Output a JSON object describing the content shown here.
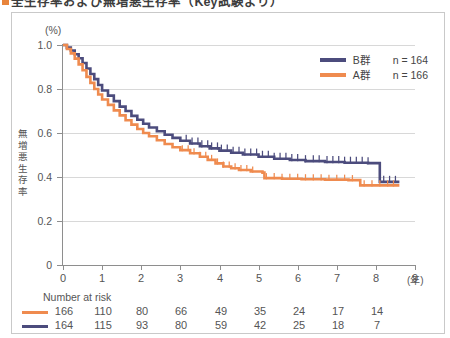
{
  "title": {
    "marker": "■",
    "text": "全生存率および無増悪生存率（Key試験より）"
  },
  "chart_data": {
    "type": "line",
    "subtype": "kaplan-meier",
    "title": "無増悪生存率",
    "xlabel": "(年)",
    "ylabel": "無増悪生存率",
    "yunit": "(%)",
    "xlim": [
      0,
      9
    ],
    "ylim": [
      0,
      1.0
    ],
    "xticks": [
      "0",
      "1",
      "2",
      "3",
      "4",
      "5",
      "6",
      "7",
      "8",
      "9"
    ],
    "yticks": [
      "0",
      "0.2",
      "0.4",
      "0.6",
      "0.8",
      "1.0"
    ],
    "grid": "horizontal",
    "legend_position": "top-right",
    "series": [
      {
        "name": "B群",
        "n_label": "n = 164",
        "n": 164,
        "color": "#4c4c7d",
        "points": [
          [
            0.0,
            1.0
          ],
          [
            0.1,
            0.988
          ],
          [
            0.2,
            0.975
          ],
          [
            0.3,
            0.958
          ],
          [
            0.4,
            0.94
          ],
          [
            0.5,
            0.918
          ],
          [
            0.6,
            0.893
          ],
          [
            0.7,
            0.868
          ],
          [
            0.8,
            0.845
          ],
          [
            0.9,
            0.818
          ],
          [
            1.0,
            0.793
          ],
          [
            1.15,
            0.77
          ],
          [
            1.3,
            0.745
          ],
          [
            1.45,
            0.72
          ],
          [
            1.6,
            0.7
          ],
          [
            1.75,
            0.678
          ],
          [
            1.9,
            0.66
          ],
          [
            2.05,
            0.642
          ],
          [
            2.2,
            0.625
          ],
          [
            2.4,
            0.608
          ],
          [
            2.6,
            0.592
          ],
          [
            2.8,
            0.578
          ],
          [
            3.0,
            0.565
          ],
          [
            3.25,
            0.552
          ],
          [
            3.5,
            0.54
          ],
          [
            3.75,
            0.53
          ],
          [
            4.0,
            0.52
          ],
          [
            4.3,
            0.51
          ],
          [
            4.6,
            0.502
          ],
          [
            5.0,
            0.492
          ],
          [
            5.4,
            0.483
          ],
          [
            5.8,
            0.477
          ],
          [
            6.2,
            0.472
          ],
          [
            6.7,
            0.468
          ],
          [
            7.2,
            0.465
          ],
          [
            7.8,
            0.463
          ],
          [
            8.05,
            0.463
          ],
          [
            8.1,
            0.378
          ],
          [
            8.6,
            0.378
          ]
        ],
        "censor_marks": [
          3.15,
          3.3,
          3.45,
          3.55,
          3.7,
          3.8,
          3.95,
          4.05,
          4.2,
          4.35,
          4.5,
          4.65,
          4.8,
          4.95,
          5.1,
          5.25,
          5.4,
          5.55,
          5.7,
          5.85,
          6.0,
          6.2,
          6.4,
          6.55,
          6.75,
          6.9,
          7.05,
          7.2,
          7.35,
          7.5,
          7.65,
          7.8,
          8.2,
          8.35,
          8.5
        ]
      },
      {
        "name": "A群",
        "n_label": "n = 166",
        "n": 166,
        "color": "#ef8b4f",
        "points": [
          [
            0.0,
            1.0
          ],
          [
            0.1,
            0.982
          ],
          [
            0.2,
            0.962
          ],
          [
            0.3,
            0.938
          ],
          [
            0.4,
            0.912
          ],
          [
            0.5,
            0.885
          ],
          [
            0.6,
            0.855
          ],
          [
            0.7,
            0.828
          ],
          [
            0.8,
            0.8
          ],
          [
            0.9,
            0.775
          ],
          [
            1.0,
            0.752
          ],
          [
            1.15,
            0.728
          ],
          [
            1.3,
            0.703
          ],
          [
            1.45,
            0.68
          ],
          [
            1.6,
            0.658
          ],
          [
            1.75,
            0.638
          ],
          [
            1.9,
            0.618
          ],
          [
            2.05,
            0.6
          ],
          [
            2.2,
            0.585
          ],
          [
            2.4,
            0.567
          ],
          [
            2.6,
            0.55
          ],
          [
            2.8,
            0.535
          ],
          [
            3.0,
            0.522
          ],
          [
            3.25,
            0.508
          ],
          [
            3.5,
            0.492
          ],
          [
            3.7,
            0.478
          ],
          [
            3.9,
            0.462
          ],
          [
            4.1,
            0.448
          ],
          [
            4.3,
            0.44
          ],
          [
            4.5,
            0.432
          ],
          [
            4.8,
            0.425
          ],
          [
            5.1,
            0.42
          ],
          [
            5.15,
            0.395
          ],
          [
            5.6,
            0.392
          ],
          [
            6.1,
            0.39
          ],
          [
            6.7,
            0.388
          ],
          [
            7.3,
            0.386
          ],
          [
            7.55,
            0.386
          ],
          [
            7.6,
            0.362
          ],
          [
            8.6,
            0.362
          ]
        ],
        "censor_marks": [
          3.05,
          3.2,
          3.35,
          3.5,
          3.65,
          3.8,
          3.95,
          4.1,
          4.25,
          4.4,
          4.55,
          4.7,
          4.85,
          5.2,
          5.4,
          5.6,
          5.8,
          6.0,
          6.2,
          6.4,
          6.6,
          6.8,
          7.0,
          7.2,
          7.4,
          7.7,
          7.9,
          8.1,
          8.3,
          8.45
        ]
      }
    ]
  },
  "number_at_risk": {
    "label": "Number at risk",
    "rows": [
      {
        "series": "A群",
        "color": "#ef8b4f",
        "values": [
          "166",
          "110",
          "80",
          "66",
          "49",
          "35",
          "24",
          "17",
          "14"
        ]
      },
      {
        "series": "B群",
        "color": "#4c4c7d",
        "values": [
          "164",
          "115",
          "93",
          "80",
          "59",
          "42",
          "25",
          "18",
          "7"
        ]
      }
    ]
  }
}
